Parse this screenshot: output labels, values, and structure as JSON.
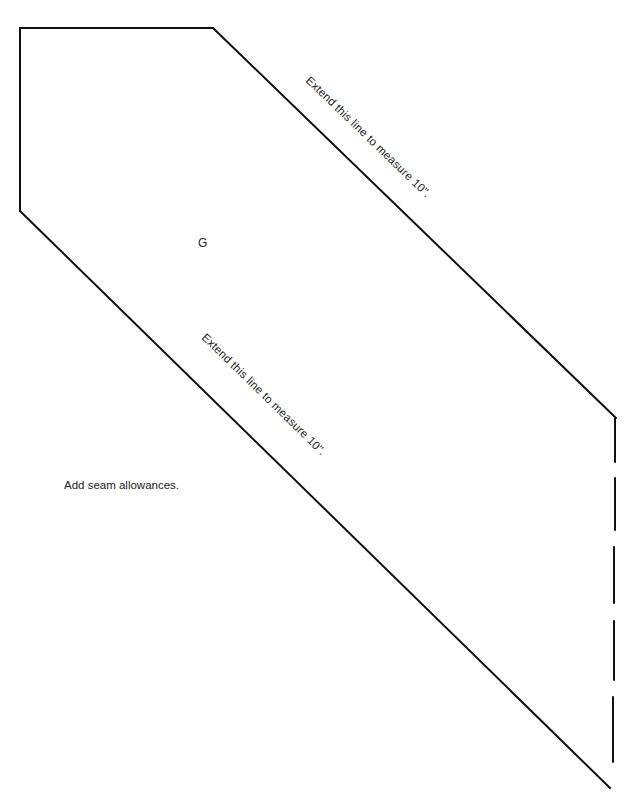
{
  "pattern": {
    "piece_letter": "G",
    "upper_edge_label": "Extend this line to measure 10\".",
    "lower_edge_label": "Extend this line to measure 10\".",
    "note": "Add seam allowances.",
    "colors": {
      "line": "#111111",
      "text": "#222222",
      "background": "#ffffff"
    }
  }
}
